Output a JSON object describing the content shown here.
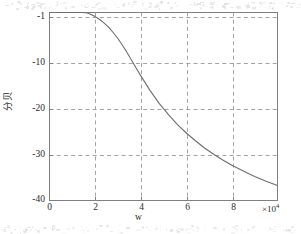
{
  "figure": {
    "background_color": "#ffffff",
    "axes_color": "#808080",
    "grid_color": "#9a9a9a",
    "curve_color": "#6e6e6e"
  },
  "chart_data": {
    "type": "line",
    "title": "",
    "xlabel": "w",
    "ylabel": "分贝",
    "x_exponent_label": "×10",
    "x_exponent_power": "4",
    "x_tick_labels": [
      "0",
      "2",
      "4",
      "6",
      "8"
    ],
    "x_tick_values": [
      0,
      20000,
      40000,
      60000,
      80000
    ],
    "y_tick_labels": [
      "-1",
      "-10",
      "-20",
      "-30",
      "-40"
    ],
    "y_tick_values": [
      -1,
      -10,
      -20,
      -30,
      -40
    ],
    "xlim": [
      0,
      100000
    ],
    "ylim": [
      -40,
      -1
    ],
    "grid": true,
    "grid_style": "dashed",
    "legend": "none",
    "series": [
      {
        "name": "magnitude-response",
        "x": [
          0,
          2000,
          4000,
          6000,
          8000,
          10000,
          12000,
          14000,
          16000,
          18000,
          20000,
          22000,
          24000,
          26000,
          28000,
          30000,
          32000,
          34000,
          36000,
          38000,
          40000,
          44000,
          48000,
          52000,
          56000,
          60000,
          64000,
          68000,
          72000,
          76000,
          80000,
          85000,
          90000,
          95000,
          100000
        ],
        "y": [
          -0.02,
          -0.04,
          -0.08,
          -0.14,
          -0.22,
          -0.35,
          -0.52,
          -0.74,
          -1.02,
          -1.38,
          -1.85,
          -2.45,
          -3.2,
          -4.1,
          -5.2,
          -6.4,
          -7.8,
          -9.3,
          -10.9,
          -12.5,
          -14.1,
          -17.1,
          -19.8,
          -22.1,
          -24.2,
          -26.0,
          -27.6,
          -29.1,
          -30.4,
          -31.6,
          -32.7,
          -33.9,
          -35.0,
          -36.0,
          -36.9
        ]
      }
    ]
  }
}
